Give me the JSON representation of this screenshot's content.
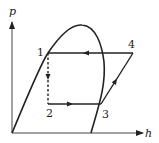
{
  "diagram": {
    "type": "p-h diagram (refrigeration cycle)",
    "axes": {
      "y_label": "p",
      "x_label": "h"
    },
    "points": [
      {
        "id": "1",
        "label": "1"
      },
      {
        "id": "2",
        "label": "2"
      },
      {
        "id": "3",
        "label": "3"
      },
      {
        "id": "4",
        "label": "4"
      }
    ],
    "processes": [
      {
        "from": "4",
        "to": "1",
        "style": "solid",
        "direction": "left"
      },
      {
        "from": "1",
        "to": "2",
        "style": "dashed",
        "direction": "down"
      },
      {
        "from": "2",
        "to": "3",
        "style": "solid",
        "direction": "right"
      },
      {
        "from": "3",
        "to": "4",
        "style": "solid",
        "direction": "up-right"
      }
    ],
    "colors": {
      "line": "#222222",
      "background": "#ffffff"
    }
  }
}
